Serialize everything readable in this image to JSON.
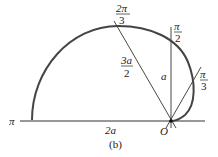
{
  "figure": {
    "caption": "(b)",
    "labels": {
      "angle_pi": "π",
      "angle_2pi3_num": "2π",
      "angle_2pi3_den": "3",
      "angle_pi2_num": "π",
      "angle_pi2_den": "2",
      "angle_pi3_num": "π",
      "angle_pi3_den": "3",
      "radius_3a2_num": "3a",
      "radius_3a2_den": "2",
      "radius_a": "a",
      "length_2a": "2a",
      "origin": "O"
    },
    "colors": {
      "stroke": "#333333",
      "curve": "#444444",
      "text": "#222222"
    }
  }
}
